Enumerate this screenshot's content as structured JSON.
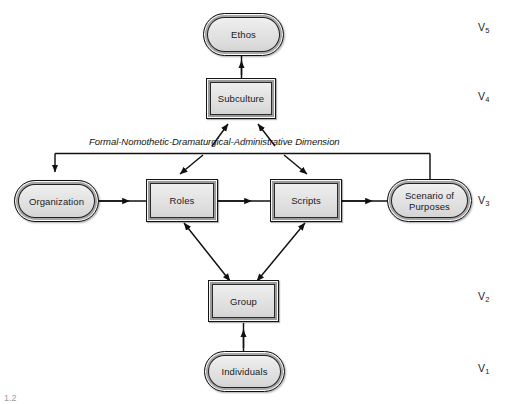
{
  "figure": {
    "dimension_label": "Formal-Nomothetic-Dramaturgical-Administrative Dimension",
    "caption_fragment": "1.2"
  },
  "nodes": [
    {
      "id": "ethos",
      "label": "Ethos",
      "shape": "round",
      "level": "V5",
      "x": 203,
      "y": 13,
      "w": 81,
      "h": 43
    },
    {
      "id": "subculture",
      "label": "Subculture",
      "shape": "rect",
      "level": "V4",
      "x": 206,
      "y": 78,
      "w": 70,
      "h": 41
    },
    {
      "id": "organization",
      "label": "Organization",
      "shape": "round",
      "level": "V3",
      "x": 14,
      "y": 180,
      "w": 85,
      "h": 42
    },
    {
      "id": "roles",
      "label": "Roles",
      "shape": "rect",
      "level": "V3",
      "x": 146,
      "y": 179,
      "w": 72,
      "h": 43
    },
    {
      "id": "scripts",
      "label": "Scripts",
      "shape": "rect",
      "level": "V3",
      "x": 270,
      "y": 179,
      "w": 72,
      "h": 43
    },
    {
      "id": "scenario",
      "label": "Scenario of Purposes",
      "shape": "round",
      "level": "V3",
      "x": 387,
      "y": 179,
      "w": 85,
      "h": 43
    },
    {
      "id": "group",
      "label": "Group",
      "shape": "rect",
      "level": "V2",
      "x": 208,
      "y": 280,
      "w": 71,
      "h": 42
    },
    {
      "id": "individuals",
      "label": "Individuals",
      "shape": "round",
      "level": "V1",
      "x": 204,
      "y": 351,
      "w": 81,
      "h": 41
    }
  ],
  "levels": [
    {
      "id": "v5",
      "label": "V",
      "sub": "5",
      "y": 21
    },
    {
      "id": "v4",
      "label": "V",
      "sub": "4",
      "y": 90
    },
    {
      "id": "v3",
      "label": "V",
      "sub": "3",
      "y": 194
    },
    {
      "id": "v2",
      "label": "V",
      "sub": "2",
      "y": 290
    },
    {
      "id": "v1",
      "label": "V",
      "sub": "1",
      "y": 362
    }
  ],
  "edges": [
    {
      "id": "individuals-to-group",
      "from": "individuals",
      "to": "group",
      "kind": "single"
    },
    {
      "id": "group-to-roles",
      "from": "group",
      "to": "roles",
      "kind": "double"
    },
    {
      "id": "group-to-scripts",
      "from": "group",
      "to": "scripts",
      "kind": "double"
    },
    {
      "id": "organization-to-roles",
      "from": "organization",
      "to": "roles",
      "kind": "single"
    },
    {
      "id": "roles-to-scripts",
      "from": "roles",
      "to": "scripts",
      "kind": "single"
    },
    {
      "id": "scripts-to-scenario",
      "from": "scripts",
      "to": "scenario",
      "kind": "single"
    },
    {
      "id": "dimension-to-organization",
      "from": "dimension-bar",
      "to": "organization",
      "kind": "single"
    },
    {
      "id": "dimension-to-roles",
      "from": "dimension-bar",
      "to": "roles",
      "kind": "single"
    },
    {
      "id": "dimension-to-scripts",
      "from": "dimension-bar",
      "to": "scripts",
      "kind": "single"
    },
    {
      "id": "dimension-to-scenario",
      "from": "dimension-bar",
      "to": "scenario",
      "kind": "plain"
    },
    {
      "id": "roles-to-subculture",
      "from": "roles-side",
      "to": "subculture",
      "kind": "single"
    },
    {
      "id": "scripts-to-subculture",
      "from": "scripts-side",
      "to": "subculture",
      "kind": "single"
    },
    {
      "id": "subculture-to-ethos",
      "from": "subculture",
      "to": "ethos",
      "kind": "single"
    }
  ],
  "colors": {
    "node_fill": "#e4e4e4",
    "node_border": "#1a1a1a",
    "line": "#111111",
    "text": "#1a1a1a",
    "background": "#ffffff"
  }
}
